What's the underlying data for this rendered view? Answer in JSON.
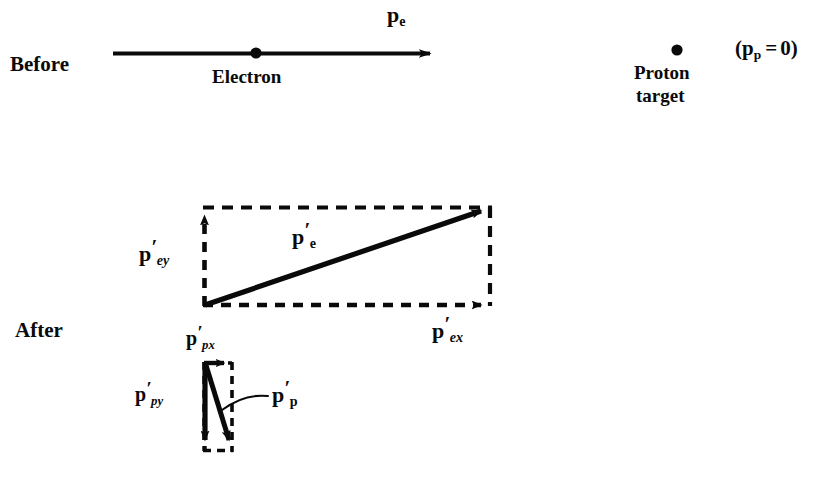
{
  "figure": {
    "background_color": "#ffffff",
    "ink_color": "#0a0a0a"
  },
  "before": {
    "phase_label": "Before",
    "electron": {
      "particle_label": "Electron",
      "momentum_symbol": "p",
      "momentum_subscript": "e",
      "arrow": {
        "x1": 113,
        "y1": 53,
        "x2": 437,
        "y2": 53,
        "style": "solid",
        "direction": "right"
      },
      "dot": {
        "cx": 256,
        "cy": 53,
        "r": 5.5
      }
    },
    "proton": {
      "particle_label_line1": "Proton",
      "particle_label_line2": "target",
      "dot": {
        "cx": 677,
        "cy": 50,
        "r": 5.5
      },
      "momentum_text_open": "(",
      "momentum_symbol": "p",
      "momentum_subscript": "p",
      "momentum_equals": "=",
      "momentum_value": "0",
      "momentum_text_close": ")"
    }
  },
  "after": {
    "phase_label": "After",
    "electron_box": {
      "origin_x": 203,
      "origin_y": 306,
      "corner_x": 492,
      "corner_y": 207,
      "resultant": {
        "symbol": "p",
        "prime": "′",
        "subscript": "e",
        "label_x": 292,
        "label_y": 226
      },
      "x_component": {
        "symbol": "p",
        "prime": "′",
        "subscript": "ex",
        "label_x": 432,
        "label_y": 320,
        "style": "dashed",
        "direction": "right"
      },
      "y_component": {
        "symbol": "p",
        "prime": "′",
        "subscript": "ey",
        "label_x": 139,
        "label_y": 243,
        "style": "dashed",
        "direction": "up"
      }
    },
    "proton_box": {
      "origin_x": 203,
      "origin_y": 362,
      "corner_x": 233,
      "corner_y": 452,
      "resultant": {
        "symbol": "p",
        "prime": "′",
        "subscript": "p",
        "label_x": 272,
        "label_y": 384,
        "leader_from_x": 316,
        "leader_from_y": 396,
        "leader_to_x": 222,
        "leader_to_y": 410
      },
      "x_component": {
        "symbol": "p",
        "prime": "′",
        "subscript": "px",
        "label_x": 186,
        "label_y": 328,
        "style": "solid",
        "direction": "right"
      },
      "y_component": {
        "symbol": "p",
        "prime": "′",
        "subscript": "py",
        "label_x": 135,
        "label_y": 384,
        "style": "solid",
        "direction": "down"
      }
    }
  }
}
